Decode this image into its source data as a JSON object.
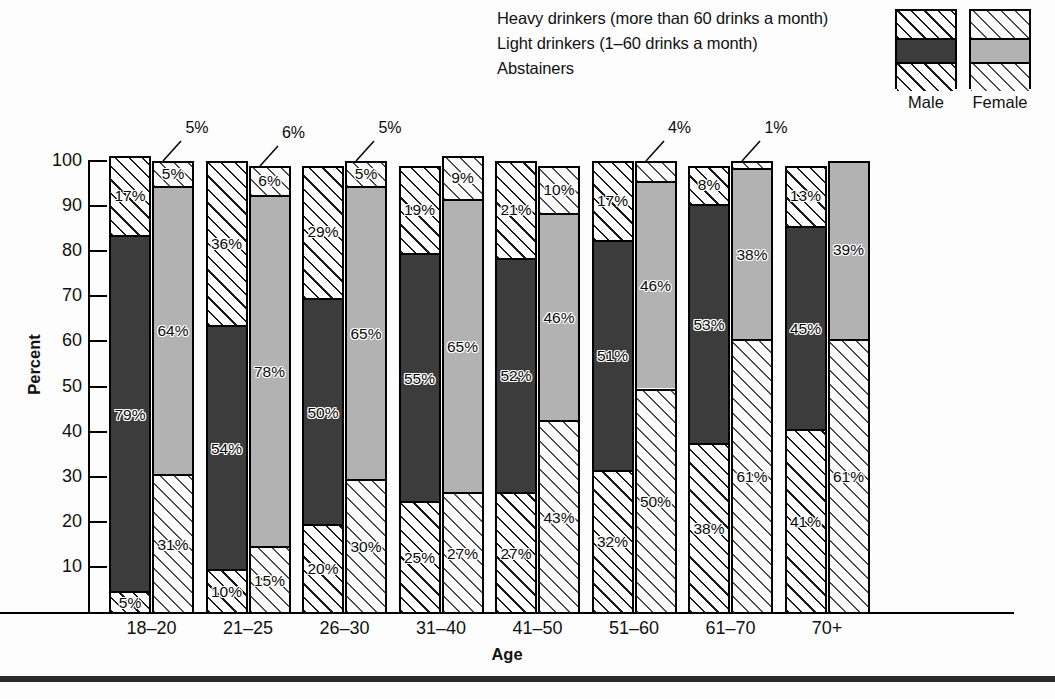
{
  "legend": {
    "labels": [
      "Heavy drinkers (more than 60 drinks a month)",
      "Light drinkers (1–60 drinks a month)",
      "Abstainers"
    ],
    "male_caption": "Male",
    "female_caption": "Female",
    "swatch_order": [
      "heavy",
      "light",
      "abstainers"
    ]
  },
  "axis": {
    "ylabel": "Percent",
    "xlabel": "Age",
    "yticks": [
      100,
      90,
      80,
      70,
      60,
      50,
      40,
      30,
      20,
      10
    ],
    "ytick_labels": [
      "100",
      "90",
      "80",
      "70",
      "60",
      "50",
      "40",
      "30",
      "20",
      "10"
    ],
    "ymin": 0,
    "ymax": 100
  },
  "colors": {
    "male_light_fill": "#3c3c3c",
    "female_light_fill": "#b2b2b2",
    "hatch_stroke": "#1a1a1a",
    "outline": "#000000",
    "background": "#fdfdfd"
  },
  "chart_data": {
    "type": "bar",
    "subtype": "stacked-grouped-100-percent",
    "title": "",
    "xlabel": "Age",
    "ylabel": "Percent",
    "ylim": [
      0,
      100
    ],
    "grid": false,
    "legend_position": "top-right",
    "categories": [
      "18–20",
      "21–25",
      "26–30",
      "31–40",
      "41–50",
      "51–60",
      "61–70",
      "70+"
    ],
    "stack_order_bottom_to_top": [
      "Abstainers",
      "Light drinkers",
      "Heavy drinkers"
    ],
    "series": [
      {
        "name": "Male – Abstainers",
        "sex": "male",
        "category": "abstainers",
        "values": [
          5,
          10,
          20,
          25,
          27,
          32,
          38,
          41
        ],
        "labels": [
          "5%",
          "10%",
          "20%",
          "25%",
          "27%",
          "32%",
          "38%",
          "41%"
        ]
      },
      {
        "name": "Male – Light drinkers",
        "sex": "male",
        "category": "light",
        "values": [
          79,
          54,
          50,
          55,
          52,
          51,
          53,
          45
        ],
        "labels": [
          "79%",
          "54%",
          "50%",
          "55%",
          "52%",
          "51%",
          "53%",
          "45%"
        ]
      },
      {
        "name": "Male – Heavy drinkers",
        "sex": "male",
        "category": "heavy",
        "values": [
          17,
          36,
          29,
          19,
          21,
          17,
          8,
          13
        ],
        "labels": [
          "17%",
          "36%",
          "29%",
          "19%",
          "21%",
          "17%",
          "8%",
          "13%"
        ]
      },
      {
        "name": "Female – Abstainers",
        "sex": "female",
        "category": "abstainers",
        "values": [
          31,
          15,
          30,
          27,
          43,
          50,
          61,
          61
        ],
        "labels": [
          "31%",
          "15%",
          "30%",
          "27%",
          "43%",
          "50%",
          "61%",
          "61%"
        ]
      },
      {
        "name": "Female – Light drinkers",
        "sex": "female",
        "category": "light",
        "values": [
          64,
          78,
          65,
          65,
          46,
          46,
          38,
          39
        ],
        "labels": [
          "64%",
          "78%",
          "65%",
          "65%",
          "46%",
          "46%",
          "38%",
          "39%"
        ]
      },
      {
        "name": "Female – Heavy drinkers",
        "sex": "female",
        "category": "heavy",
        "values": [
          5,
          6,
          5,
          9,
          10,
          4,
          1,
          0
        ],
        "labels": [
          "5%",
          "6%",
          "5%",
          "9%",
          "10%",
          "4%",
          "1%",
          ""
        ]
      }
    ],
    "callouts": [
      {
        "group": "18–20",
        "sex": "female",
        "category": "heavy",
        "text": "5%"
      },
      {
        "group": "21–25",
        "sex": "female",
        "category": "heavy",
        "text": "6%"
      },
      {
        "group": "26–30",
        "sex": "female",
        "category": "heavy",
        "text": "5%"
      },
      {
        "group": "51–60",
        "sex": "female",
        "category": "heavy",
        "text": "4%"
      },
      {
        "group": "61–70",
        "sex": "female",
        "category": "heavy",
        "text": "1%"
      }
    ]
  }
}
